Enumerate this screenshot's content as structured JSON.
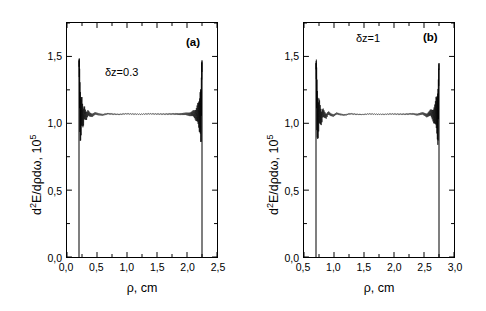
{
  "figure": {
    "background": "#ffffff",
    "line_color": "#000000",
    "panel_count": 2
  },
  "chart_data": [
    {
      "type": "line",
      "panel_label": "(a)",
      "annotation": "δz=0.3",
      "title": "",
      "xlabel": "ρ, cm",
      "ylabel_main": "d",
      "ylabel_sup1": "2",
      "ylabel_mid": "E/dρdω, 10",
      "ylabel_sup2": "5",
      "ylabel_full": "d²E/dρdω, 10⁵",
      "xlim": [
        0.0,
        2.5
      ],
      "ylim": [
        0.0,
        1.75
      ],
      "xticks": [
        0.0,
        0.5,
        1.0,
        1.5,
        2.0,
        2.5
      ],
      "xticklabels": [
        "0,0",
        "0,5",
        "1,0",
        "1,5",
        "2,0",
        "2,5"
      ],
      "yticks": [
        0.0,
        0.5,
        1.0,
        1.5
      ],
      "yticklabels": [
        "0,0",
        "0,5",
        "1,0",
        "1,5"
      ],
      "minor_xticks": [
        0.25,
        0.75,
        1.25,
        1.75,
        2.25
      ],
      "minor_yticks": [
        0.25,
        0.75,
        1.25,
        1.75
      ],
      "grid": false,
      "legend": "none",
      "edge_left": 0.2,
      "edge_right": 2.25,
      "plateau_value": 1.07,
      "peak_value": 1.47,
      "baseline_value": 0.0,
      "series": [
        {
          "name": "d2E/dpdw",
          "comment": "transition-radiation radial distribution: sharp edge spikes with Airy-type oscillations decaying toward plateau",
          "x": [
            0.2,
            0.205,
            0.212,
            0.22,
            0.232,
            0.245,
            0.258,
            0.272,
            0.288,
            0.305,
            0.325,
            0.35,
            0.38,
            0.42,
            0.47,
            0.53,
            0.6,
            0.68,
            0.77,
            0.87,
            0.98,
            1.1,
            1.23,
            1.37,
            1.51,
            1.65,
            1.78,
            1.89,
            1.98,
            2.05,
            2.105,
            2.148,
            2.18,
            2.205,
            2.222,
            2.234,
            2.242,
            2.247,
            2.25
          ],
          "y": [
            0.0,
            1.47,
            1.25,
            1.06,
            0.975,
            1.14,
            1.06,
            0.995,
            1.1,
            1.06,
            1.03,
            1.09,
            1.06,
            1.045,
            1.08,
            1.062,
            1.055,
            1.075,
            1.066,
            1.062,
            1.072,
            1.068,
            1.066,
            1.071,
            1.068,
            1.067,
            1.07,
            1.066,
            1.072,
            1.062,
            1.082,
            1.046,
            1.098,
            1.03,
            1.12,
            0.99,
            1.19,
            1.46,
            0.0
          ]
        }
      ]
    },
    {
      "type": "line",
      "panel_label": "(b)",
      "annotation": "δz=1",
      "title": "",
      "xlabel": "ρ, cm",
      "ylabel_main": "d",
      "ylabel_sup1": "2",
      "ylabel_mid": "E/dρdω, 10",
      "ylabel_sup2": "5",
      "ylabel_full": "d²E/dρdω, 10⁵",
      "xlim": [
        0.5,
        3.0
      ],
      "ylim": [
        0.0,
        1.75
      ],
      "xticks": [
        0.5,
        1.0,
        1.5,
        2.0,
        2.5,
        3.0
      ],
      "xticklabels": [
        "0,5",
        "1,0",
        "1,5",
        "2,0",
        "2,5",
        "3,0"
      ],
      "yticks": [
        0.0,
        0.5,
        1.0,
        1.5
      ],
      "yticklabels": [
        "0,0",
        "0,5",
        "1,0",
        "1,5"
      ],
      "minor_xticks": [
        0.75,
        1.25,
        1.75,
        2.25,
        2.75
      ],
      "minor_yticks": [
        0.25,
        0.75,
        1.25,
        1.75
      ],
      "grid": false,
      "legend": "none",
      "edge_left": 0.7,
      "edge_right": 2.75,
      "plateau_value": 1.07,
      "peak_value": 1.45,
      "baseline_value": 0.0,
      "series": [
        {
          "name": "d2E/dpdw",
          "comment": "transition-radiation radial distribution: sharp edge spikes with Airy-type oscillations decaying toward plateau",
          "x": [
            0.7,
            0.706,
            0.714,
            0.724,
            0.738,
            0.754,
            0.772,
            0.792,
            0.815,
            0.842,
            0.872,
            0.906,
            0.945,
            0.99,
            1.045,
            1.11,
            1.185,
            1.27,
            1.365,
            1.47,
            1.585,
            1.705,
            1.83,
            1.955,
            2.075,
            2.19,
            2.295,
            2.39,
            2.475,
            2.548,
            2.61,
            2.66,
            2.7,
            2.73,
            2.748,
            2.74,
            2.75,
            2.751,
            2.752
          ],
          "y": [
            0.0,
            1.45,
            1.23,
            1.05,
            0.97,
            1.135,
            1.055,
            0.99,
            1.098,
            1.058,
            1.028,
            1.088,
            1.058,
            1.043,
            1.078,
            1.06,
            1.053,
            1.073,
            1.064,
            1.06,
            1.07,
            1.066,
            1.064,
            1.069,
            1.066,
            1.065,
            1.072,
            1.058,
            1.08,
            1.042,
            1.096,
            1.028,
            1.118,
            0.988,
            1.188,
            1.45,
            1.33,
            0.6,
            0.0
          ]
        }
      ]
    }
  ]
}
